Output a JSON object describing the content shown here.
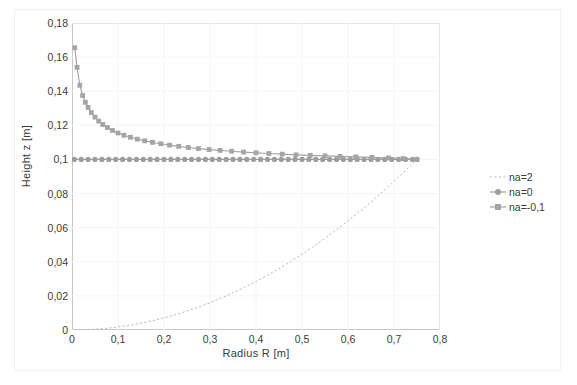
{
  "chart_data": {
    "type": "line",
    "title": "",
    "xlabel": "Radius R [m]",
    "ylabel": "Height z [m]",
    "xlim": [
      0,
      0.8
    ],
    "ylim": [
      0,
      0.18
    ],
    "xticks": [
      "0",
      "0,1",
      "0,2",
      "0,3",
      "0,4",
      "0,5",
      "0,6",
      "0,7",
      "0,8"
    ],
    "xtick_values": [
      0,
      0.1,
      0.2,
      0.3,
      0.4,
      0.5,
      0.6,
      0.7,
      0.8
    ],
    "yticks": [
      "0",
      "0,02",
      "0,04",
      "0,06",
      "0,08",
      "0,1",
      "0,12",
      "0,14",
      "0,16",
      "0,18"
    ],
    "ytick_values": [
      0,
      0.02,
      0.04,
      0.06,
      0.08,
      0.1,
      0.12,
      0.14,
      0.16,
      0.18
    ],
    "grid": true,
    "legend_position": "right",
    "series": [
      {
        "name": "na=2",
        "style": "dashed-line",
        "color": "#b9b9b9",
        "marker": "none",
        "x": [
          0.005,
          0.025,
          0.05,
          0.075,
          0.1,
          0.125,
          0.15,
          0.175,
          0.2,
          0.225,
          0.25,
          0.275,
          0.3,
          0.325,
          0.35,
          0.375,
          0.4,
          0.425,
          0.45,
          0.475,
          0.5,
          0.525,
          0.55,
          0.575,
          0.6,
          0.625,
          0.65,
          0.675,
          0.7,
          0.725,
          0.75
        ],
        "y": [
          0.0,
          0.00011,
          0.00044,
          0.001,
          0.00178,
          0.00278,
          0.004,
          0.00544,
          0.00711,
          0.009,
          0.01111,
          0.01344,
          0.016,
          0.01878,
          0.02178,
          0.025,
          0.02844,
          0.03211,
          0.036,
          0.04011,
          0.04444,
          0.049,
          0.05378,
          0.05878,
          0.064,
          0.06944,
          0.07511,
          0.081,
          0.08711,
          0.09344,
          0.1
        ]
      },
      {
        "name": "na=0",
        "style": "marker-line",
        "color": "#9d9d9d",
        "marker": "circle",
        "x": [
          0.005,
          0.02,
          0.035,
          0.05,
          0.065,
          0.08,
          0.095,
          0.11,
          0.125,
          0.14,
          0.155,
          0.17,
          0.185,
          0.2,
          0.215,
          0.23,
          0.245,
          0.26,
          0.275,
          0.29,
          0.305,
          0.32,
          0.335,
          0.35,
          0.365,
          0.38,
          0.395,
          0.41,
          0.425,
          0.44,
          0.455,
          0.47,
          0.485,
          0.5,
          0.515,
          0.53,
          0.545,
          0.56,
          0.575,
          0.59,
          0.605,
          0.62,
          0.635,
          0.65,
          0.665,
          0.68,
          0.695,
          0.71,
          0.725,
          0.74,
          0.75
        ],
        "y": [
          0.1,
          0.1,
          0.1,
          0.1,
          0.1,
          0.1,
          0.1,
          0.1,
          0.1,
          0.1,
          0.1,
          0.1,
          0.1,
          0.1,
          0.1,
          0.1,
          0.1,
          0.1,
          0.1,
          0.1,
          0.1,
          0.1,
          0.1,
          0.1,
          0.1,
          0.1,
          0.1,
          0.1,
          0.1,
          0.1,
          0.1,
          0.1,
          0.1,
          0.1,
          0.1,
          0.1,
          0.1,
          0.1,
          0.1,
          0.1,
          0.1,
          0.1,
          0.1,
          0.1,
          0.1,
          0.1,
          0.1,
          0.1,
          0.1,
          0.1,
          0.1
        ]
      },
      {
        "name": "na=-0,1",
        "style": "marker-line",
        "color": "#a5a5a5",
        "marker": "square",
        "x": [
          0.006,
          0.011,
          0.017,
          0.023,
          0.029,
          0.035,
          0.042,
          0.05,
          0.058,
          0.067,
          0.077,
          0.088,
          0.1,
          0.113,
          0.127,
          0.142,
          0.158,
          0.175,
          0.193,
          0.212,
          0.232,
          0.253,
          0.275,
          0.298,
          0.322,
          0.347,
          0.373,
          0.4,
          0.428,
          0.457,
          0.487,
          0.518,
          0.55,
          0.583,
          0.617,
          0.652,
          0.688,
          0.72,
          0.75
        ],
        "y": [
          0.1655,
          0.154,
          0.1435,
          0.1375,
          0.1335,
          0.1305,
          0.1275,
          0.1248,
          0.1225,
          0.1205,
          0.1187,
          0.117,
          0.1155,
          0.1142,
          0.113,
          0.1119,
          0.1109,
          0.11,
          0.1092,
          0.1084,
          0.1077,
          0.107,
          0.1064,
          0.1058,
          0.1053,
          0.1048,
          0.1043,
          0.1039,
          0.1035,
          0.1031,
          0.1027,
          0.1024,
          0.1021,
          0.1018,
          0.1015,
          0.1012,
          0.1009,
          0.1005,
          0.1001
        ]
      }
    ]
  },
  "legend": {
    "items": [
      {
        "label": "na=2"
      },
      {
        "label": "na=0"
      },
      {
        "label": "na=-0,1"
      }
    ]
  },
  "colors": {
    "axis": "#9a9a9a",
    "grid": "#f4f4f4",
    "text": "#3a3a3a",
    "series_na2": "#b9b9b9",
    "series_na0": "#9d9d9d",
    "series_nam01": "#a5a5a5"
  }
}
